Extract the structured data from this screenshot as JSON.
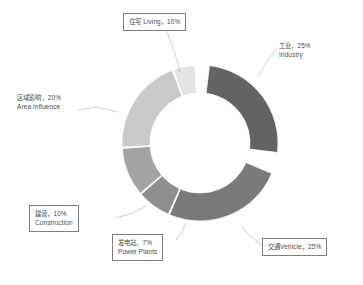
{
  "chart_data": {
    "type": "pie",
    "variant": "donut",
    "title": "",
    "xlabel": "",
    "ylabel": "",
    "legend_position": "none",
    "grid": false,
    "units": "percent",
    "total": 97,
    "categories": [
      "工业 Industry",
      "交通 Vehicle",
      "发电站 Power Plants",
      "建设 Construction",
      "区域影响 Area Influence",
      "住宅 Living"
    ],
    "values": [
      25,
      25,
      7,
      10,
      20,
      10
    ],
    "colors": [
      "#636363",
      "#7a7a7a",
      "#8e8e8e",
      "#a3a3a3",
      "#c9c9c9",
      "#e3e3e3"
    ],
    "slices": [
      {
        "key": "industry",
        "label_cn": "工业，25%",
        "label_en": "Industry",
        "value": 25,
        "color": "#636363",
        "start_angle": 7,
        "end_angle": 97,
        "boxed": false
      },
      {
        "key": "vehicle",
        "label_cn": "交通Vehicle，25%",
        "label_en": "",
        "value": 25,
        "color": "#7a7a7a",
        "start_angle": 113,
        "end_angle": 203,
        "boxed": true
      },
      {
        "key": "power_plants",
        "label_cn": "发电站，7%",
        "label_en": "Power Plants",
        "value": 7,
        "color": "#8e8e8e",
        "start_angle": 204,
        "end_angle": 229,
        "boxed": true
      },
      {
        "key": "construction",
        "label_cn": "建设，10%",
        "label_en": "Construction",
        "value": 10,
        "color": "#a3a3a3",
        "start_angle": 230,
        "end_angle": 266,
        "boxed": true
      },
      {
        "key": "area_influence",
        "label_cn": "区域影响，20%",
        "label_en": "Area Influence",
        "value": 20,
        "color": "#c9c9c9",
        "start_angle": 267,
        "end_angle": 339,
        "boxed": false
      },
      {
        "key": "living",
        "label_cn": "住宅 Living，10%",
        "label_en": "",
        "value": 10,
        "color": "#e3e3e3",
        "start_angle": 340,
        "end_angle": 356,
        "boxed": true
      }
    ]
  },
  "labels": {
    "living": {
      "line1": "住宅 Living，10%"
    },
    "industry": {
      "line1": "工业，25%",
      "line2": "Industry"
    },
    "area_influence": {
      "line1": "区域影响，20%",
      "line2": "Area Influence"
    },
    "construction": {
      "line1": "建设，10%",
      "line2": "Construction"
    },
    "power_plants": {
      "line1": "发电站，7%",
      "line2": "Power Plants"
    },
    "vehicle": {
      "line1": "交通Vehicle，25%"
    }
  },
  "style": {
    "background": "#ffffff",
    "label_text_color": "#4a4a4a",
    "label_box_border": "#7d7d7d",
    "leader_line_color": "#b9b9b9"
  },
  "geometry": {
    "center_x": 200,
    "center_y": 143,
    "outer_radius": 78,
    "inner_radius": 50
  }
}
